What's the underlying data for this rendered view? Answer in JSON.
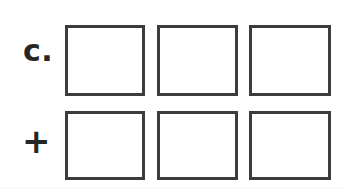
{
  "page": {
    "background_color": "#ffffff",
    "ink_color": "#3c3c3c",
    "text_color": "#262626"
  },
  "exercise": {
    "item_label": "c.",
    "operator_label": "+",
    "operator_icon": "plus-icon"
  },
  "rows": [
    {
      "label": "c.",
      "name": "addend-row",
      "boxes": [
        {
          "value": "",
          "placeholder": ""
        },
        {
          "value": "",
          "placeholder": ""
        },
        {
          "value": "",
          "placeholder": ""
        }
      ]
    },
    {
      "label": "+",
      "name": "operator-row",
      "boxes": [
        {
          "value": "",
          "placeholder": ""
        },
        {
          "value": "",
          "placeholder": ""
        },
        {
          "value": "",
          "placeholder": ""
        }
      ]
    }
  ]
}
